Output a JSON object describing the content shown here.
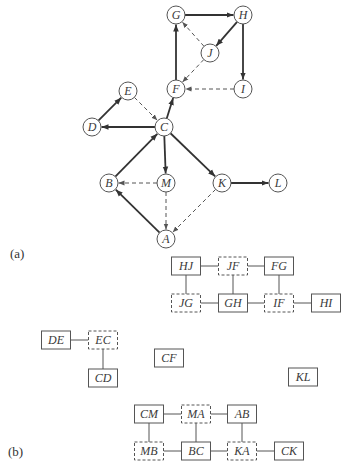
{
  "panels": {
    "a": {
      "label": "(a)",
      "nodes": [
        {
          "id": "G",
          "x": 176,
          "y": 15
        },
        {
          "id": "H",
          "x": 243,
          "y": 15
        },
        {
          "id": "J",
          "x": 210,
          "y": 53
        },
        {
          "id": "F",
          "x": 176,
          "y": 89
        },
        {
          "id": "I",
          "x": 243,
          "y": 89
        },
        {
          "id": "E",
          "x": 128,
          "y": 91
        },
        {
          "id": "D",
          "x": 92,
          "y": 127
        },
        {
          "id": "C",
          "x": 164,
          "y": 127
        },
        {
          "id": "B",
          "x": 109,
          "y": 183
        },
        {
          "id": "M",
          "x": 166,
          "y": 183
        },
        {
          "id": "K",
          "x": 222,
          "y": 183
        },
        {
          "id": "L",
          "x": 278,
          "y": 183
        },
        {
          "id": "A",
          "x": 166,
          "y": 239
        }
      ],
      "edges": [
        {
          "from": "G",
          "to": "H",
          "style": "solid"
        },
        {
          "from": "H",
          "to": "J",
          "style": "solid"
        },
        {
          "from": "H",
          "to": "I",
          "style": "solid"
        },
        {
          "from": "J",
          "to": "G",
          "style": "dashed"
        },
        {
          "from": "J",
          "to": "F",
          "style": "dashed"
        },
        {
          "from": "I",
          "to": "F",
          "style": "dashed"
        },
        {
          "from": "F",
          "to": "G",
          "style": "solid"
        },
        {
          "from": "C",
          "to": "F",
          "style": "solid"
        },
        {
          "from": "D",
          "to": "E",
          "style": "solid"
        },
        {
          "from": "E",
          "to": "C",
          "style": "dashed"
        },
        {
          "from": "C",
          "to": "D",
          "style": "solid"
        },
        {
          "from": "B",
          "to": "C",
          "style": "solid"
        },
        {
          "from": "C",
          "to": "M",
          "style": "solid"
        },
        {
          "from": "C",
          "to": "K",
          "style": "solid"
        },
        {
          "from": "K",
          "to": "L",
          "style": "solid"
        },
        {
          "from": "M",
          "to": "B",
          "style": "dashed"
        },
        {
          "from": "M",
          "to": "A",
          "style": "dashed"
        },
        {
          "from": "K",
          "to": "A",
          "style": "dashed"
        },
        {
          "from": "A",
          "to": "B",
          "style": "solid"
        }
      ]
    },
    "b": {
      "label": "(b)",
      "boxes": [
        {
          "id": "HJ",
          "label": "HJ",
          "x": 186,
          "y": 266,
          "style": "solid"
        },
        {
          "id": "JF",
          "label": "JF",
          "x": 233,
          "y": 266,
          "style": "dashed"
        },
        {
          "id": "FG",
          "label": "FG",
          "x": 279,
          "y": 266,
          "style": "solid"
        },
        {
          "id": "JG",
          "label": "JG",
          "x": 186,
          "y": 303,
          "style": "dashed"
        },
        {
          "id": "GH",
          "label": "GH",
          "x": 233,
          "y": 303,
          "style": "solid"
        },
        {
          "id": "IF",
          "label": "IF",
          "x": 279,
          "y": 303,
          "style": "dashed"
        },
        {
          "id": "HI",
          "label": "HI",
          "x": 326,
          "y": 303,
          "style": "solid"
        },
        {
          "id": "DE",
          "label": "DE",
          "x": 56,
          "y": 340,
          "style": "solid"
        },
        {
          "id": "EC",
          "label": "EC",
          "x": 103,
          "y": 340,
          "style": "dashed"
        },
        {
          "id": "CD",
          "label": "CD",
          "x": 103,
          "y": 378,
          "style": "solid"
        },
        {
          "id": "CF",
          "label": "CF",
          "x": 169,
          "y": 358,
          "style": "solid"
        },
        {
          "id": "KL",
          "label": "KL",
          "x": 303,
          "y": 377,
          "style": "solid"
        },
        {
          "id": "CM",
          "label": "CM",
          "x": 149,
          "y": 414,
          "style": "solid"
        },
        {
          "id": "MA",
          "label": "MA",
          "x": 196,
          "y": 414,
          "style": "dashed"
        },
        {
          "id": "AB",
          "label": "AB",
          "x": 242,
          "y": 414,
          "style": "solid"
        },
        {
          "id": "MB",
          "label": "MB",
          "x": 149,
          "y": 451,
          "style": "dashed"
        },
        {
          "id": "BC",
          "label": "BC",
          "x": 196,
          "y": 451,
          "style": "solid"
        },
        {
          "id": "KA",
          "label": "KA",
          "x": 242,
          "y": 451,
          "style": "dashed"
        },
        {
          "id": "CK",
          "label": "CK",
          "x": 289,
          "y": 451,
          "style": "solid"
        }
      ],
      "links": [
        [
          "HJ",
          "JF"
        ],
        [
          "JF",
          "FG"
        ],
        [
          "HJ",
          "JG"
        ],
        [
          "JF",
          "GH"
        ],
        [
          "FG",
          "IF"
        ],
        [
          "JG",
          "GH"
        ],
        [
          "GH",
          "IF"
        ],
        [
          "IF",
          "HI"
        ],
        [
          "DE",
          "EC"
        ],
        [
          "EC",
          "CD"
        ],
        [
          "CM",
          "MA"
        ],
        [
          "MA",
          "AB"
        ],
        [
          "CM",
          "MB"
        ],
        [
          "MA",
          "BC"
        ],
        [
          "AB",
          "KA"
        ],
        [
          "MB",
          "BC"
        ],
        [
          "BC",
          "KA"
        ],
        [
          "KA",
          "CK"
        ]
      ]
    }
  },
  "colors": {
    "stroke": "#3a3a3a",
    "background": "#ffffff"
  }
}
